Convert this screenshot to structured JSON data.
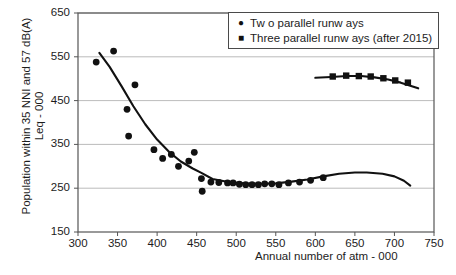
{
  "chart_data": {
    "type": "scatter",
    "title": "",
    "xlabel": "Annual number of atm - 000",
    "ylabel": "Population within 35 NNI and 57 dB(A)\nLeq - 000",
    "xlim": [
      300,
      750
    ],
    "ylim": [
      150,
      650
    ],
    "xticks": [
      300,
      350,
      400,
      450,
      500,
      550,
      600,
      650,
      700,
      750
    ],
    "yticks": [
      150,
      250,
      350,
      450,
      550,
      650
    ],
    "grid": "horizontal",
    "legend_position": "top-right",
    "series": [
      {
        "name": "Tw o parallel runw ays",
        "marker": "circle",
        "color": "#111111",
        "points": [
          [
            323,
            538
          ],
          [
            345,
            563
          ],
          [
            362,
            430
          ],
          [
            364,
            369
          ],
          [
            372,
            486
          ],
          [
            396,
            338
          ],
          [
            407,
            318
          ],
          [
            418,
            327
          ],
          [
            427,
            300
          ],
          [
            440,
            312
          ],
          [
            447,
            332
          ],
          [
            456,
            272
          ],
          [
            457,
            243
          ],
          [
            468,
            264
          ],
          [
            478,
            263
          ],
          [
            489,
            262
          ],
          [
            496,
            262
          ],
          [
            504,
            259
          ],
          [
            512,
            258
          ],
          [
            520,
            258
          ],
          [
            528,
            258
          ],
          [
            536,
            260
          ],
          [
            545,
            260
          ],
          [
            554,
            258
          ],
          [
            566,
            262
          ],
          [
            580,
            264
          ],
          [
            594,
            268
          ],
          [
            610,
            274
          ]
        ],
        "trend": [
          [
            327,
            559
          ],
          [
            340,
            527
          ],
          [
            355,
            483
          ],
          [
            370,
            437
          ],
          [
            385,
            396
          ],
          [
            400,
            361
          ],
          [
            415,
            333
          ],
          [
            430,
            311
          ],
          [
            445,
            295
          ],
          [
            456,
            285
          ],
          [
            470,
            271
          ],
          [
            490,
            264
          ],
          [
            510,
            261
          ],
          [
            530,
            260
          ],
          [
            550,
            261
          ],
          [
            570,
            265
          ],
          [
            590,
            270
          ],
          [
            610,
            277
          ],
          [
            630,
            283
          ],
          [
            650,
            286
          ],
          [
            665,
            286
          ],
          [
            685,
            283
          ],
          [
            700,
            277
          ],
          [
            712,
            267
          ],
          [
            720,
            256
          ]
        ]
      },
      {
        "name": "Three parallel runw ays (after 2015)",
        "marker": "square",
        "color": "#111111",
        "points": [
          [
            622,
            505
          ],
          [
            639,
            507
          ],
          [
            655,
            506
          ],
          [
            670,
            505
          ],
          [
            686,
            501
          ],
          [
            701,
            496
          ],
          [
            717,
            491
          ]
        ],
        "trend": [
          [
            600,
            502
          ],
          [
            620,
            504
          ],
          [
            640,
            506
          ],
          [
            658,
            506
          ],
          [
            675,
            503
          ],
          [
            692,
            498
          ],
          [
            708,
            491
          ],
          [
            722,
            483
          ],
          [
            730,
            478
          ]
        ]
      }
    ]
  },
  "axes": {
    "y_title": "Population within 35 NNI and 57 dB(A)\nLeq - 000",
    "x_title": "Annual number of atm - 000",
    "y_tick_labels": [
      "650",
      "550",
      "450",
      "350",
      "250",
      "150"
    ],
    "x_tick_labels": [
      "300",
      "350",
      "400",
      "450",
      "500",
      "550",
      "600",
      "650",
      "700",
      "750"
    ]
  },
  "legend": {
    "items": [
      {
        "marker": "●",
        "label": "Tw o parallel runw ays",
        "marker_name": "circle-marker"
      },
      {
        "marker": "■",
        "label": "Three parallel runw ays (after 2015)",
        "marker_name": "square-marker"
      }
    ]
  },
  "colors": {
    "series": "#111111",
    "grid": "#a9a9a9",
    "axis": "#555555",
    "text": "#1c1c1c"
  }
}
